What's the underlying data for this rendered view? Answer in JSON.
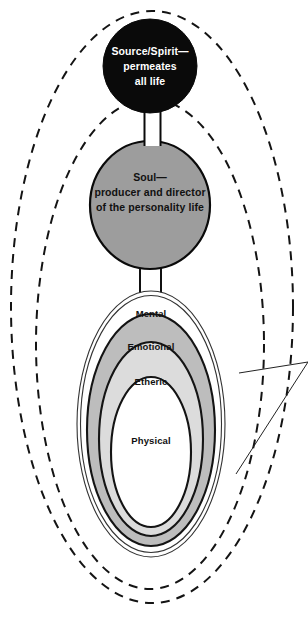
{
  "diagram": {
    "type": "concentric-ellipse-diagram",
    "background_color": "#ffffff",
    "width": 308,
    "height": 618,
    "spirit": {
      "label_lines": [
        "Source/Spirit—",
        "permeates",
        "all life"
      ],
      "fill": "#0a0a0a",
      "text_color": "#ffffff",
      "shape": "circle"
    },
    "soul": {
      "label_lines": [
        "Soul—",
        "producer and director",
        "of the personality life"
      ],
      "fill": "#9d9d9d",
      "text_color": "#111111",
      "shape": "ellipse"
    },
    "bodies": [
      {
        "label": "Mental",
        "fill": "#ffffff",
        "text_color": "#111111"
      },
      {
        "label": "Emotional",
        "fill": "#bdbdbd",
        "text_color": "#111111"
      },
      {
        "label": "Etheric",
        "fill": "#dcdcdc",
        "text_color": "#111111"
      },
      {
        "label": "Physical",
        "fill": "#ffffff",
        "text_color": "#111111"
      }
    ],
    "aura_rings": [
      {
        "name": "outer-dashed-aura",
        "style": "dashed",
        "stroke": "#111111"
      },
      {
        "name": "inner-dashed-aura",
        "style": "dashed",
        "stroke": "#111111"
      }
    ],
    "connectors": [
      {
        "name": "spirit-to-soul-connector",
        "style": "double-vertical-line"
      },
      {
        "name": "soul-to-bodies-connector",
        "style": "double-vertical-line"
      }
    ],
    "leader_lines": [
      {
        "name": "leader-line-upper",
        "style": "thin-solid"
      },
      {
        "name": "leader-line-lower",
        "style": "thin-solid"
      }
    ]
  }
}
